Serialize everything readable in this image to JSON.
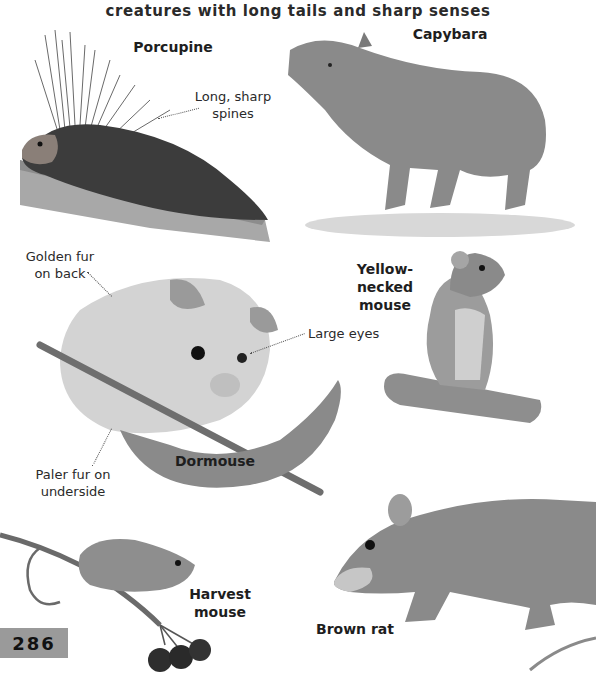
{
  "page": {
    "subtitle": "creatures with long tails and sharp senses",
    "page_number": "286"
  },
  "animals": {
    "porcupine": {
      "name": "Porcupine",
      "callouts": [
        "Long, sharp",
        "spines"
      ]
    },
    "capybara": {
      "name": "Capybara"
    },
    "dormouse": {
      "name": "Dormouse",
      "callout_back": [
        "Golden fur",
        "on back"
      ],
      "callout_eyes": "Large eyes",
      "callout_under": [
        "Paler fur on",
        "underside"
      ]
    },
    "yellow_necked_mouse": {
      "name": [
        "Yellow-necked",
        "mouse"
      ]
    },
    "harvest_mouse": {
      "name": [
        "Harvest",
        "mouse"
      ]
    },
    "brown_rat": {
      "name": "Brown rat"
    }
  },
  "colors": {
    "fur_dark": "#3a3a3a",
    "fur_mid": "#7a7a7a",
    "fur_light": "#c8c8c8",
    "page_tab": "#9a9a9a"
  }
}
